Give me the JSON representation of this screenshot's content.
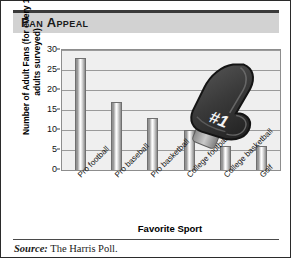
{
  "title": "Fan Appeal",
  "source": {
    "label": "Source:",
    "text": " The Harris Poll."
  },
  "overlay": {
    "foam_hand_text": "#1",
    "foam_hand_icon": "foam-finger-icon"
  },
  "colors": {
    "title_band": "#d2d2d2",
    "plot_background": "#efefef",
    "bar_fill": "#b5b5b5",
    "gridline": "#9a9a9a",
    "border": "#2b2b2b",
    "foam_hand": "#3b3b3b"
  },
  "chart_data": {
    "type": "bar",
    "title": "Fan Appeal",
    "xlabel": "Favorite Sport",
    "ylabel": "Number of Adult Fans (for every 100 adults surveyed)",
    "categories": [
      "Pro football",
      "Pro baseball",
      "Pro basketball",
      "College football",
      "College basketball",
      "Golf"
    ],
    "values": [
      28,
      17,
      13,
      10,
      6,
      6
    ],
    "ylim": [
      0,
      30
    ],
    "yticks": [
      0,
      5,
      10,
      15,
      20,
      25,
      30
    ],
    "grid": true,
    "legend": false
  }
}
